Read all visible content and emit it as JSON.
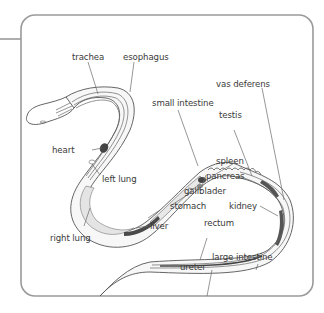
{
  "diagram": {
    "title": "",
    "colors": {
      "frame": "#9a9a9a",
      "outline": "#555555",
      "lung_fill": "#e6e6e6",
      "dark_organ": "#4a4a4a",
      "label_text": "#3a3a3a"
    },
    "labels": {
      "trachea": "trachea",
      "esophagus": "esophagus",
      "vas_deferens": "vas deferens",
      "small_intestine": "small intestine",
      "testis": "testis",
      "heart": "heart",
      "spleen": "spleen",
      "pancreas": "pancreas",
      "left_lung": "left lung",
      "gallbladder": "gallblader",
      "stomach": "stomach",
      "kidney": "kidney",
      "liver": "liver",
      "rectum": "rectum",
      "right_lung": "right lung",
      "ureter": "ureter",
      "large_intestine": "large intestine"
    }
  }
}
